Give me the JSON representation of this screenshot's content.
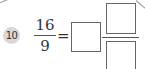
{
  "problem": {
    "number": "10",
    "given_fraction": {
      "numerator": "16",
      "denominator": "9"
    },
    "operator": "=",
    "answer": {
      "type": "mixed-number",
      "whole": "",
      "numerator": "",
      "denominator": ""
    }
  },
  "colors": {
    "badge_background": "#d9d9d9",
    "text": "#333333",
    "box_border": "#666666"
  }
}
